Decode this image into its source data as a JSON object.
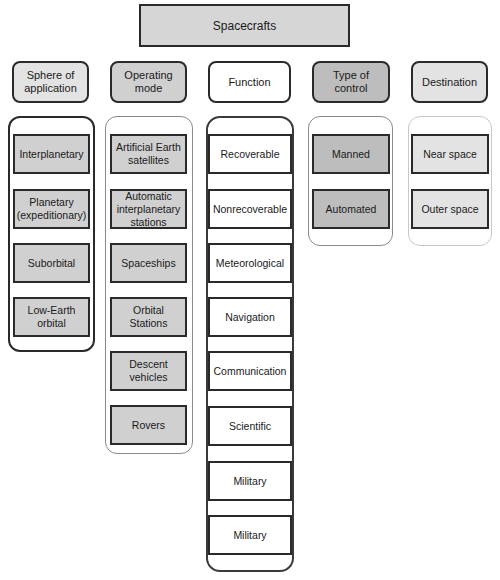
{
  "diagram": {
    "root": "Spacecrafts",
    "categories": [
      {
        "title": "Sphere of application",
        "items": [
          "Interplanetary",
          "Planetary (expeditionary)",
          "Suborbital",
          "Low-Earth orbital"
        ]
      },
      {
        "title": "Operating mode",
        "items": [
          "Artificial Earth satellites",
          "Automatic interplanetary stations",
          "Spaceships",
          "Orbital Stations",
          "Descent vehicles",
          "Rovers"
        ]
      },
      {
        "title": "Function",
        "items": [
          "Recoverable",
          "Nonrecoverable",
          "Meteorological",
          "Navigation",
          "Communication",
          "Scientific",
          "Military",
          "Military"
        ]
      },
      {
        "title": "Type of control",
        "items": [
          "Manned",
          "Automated"
        ]
      },
      {
        "title": "Destination",
        "items": [
          "Near space",
          "Outer space"
        ]
      }
    ]
  },
  "colors": {
    "border_dark": "#2a2a2a",
    "fill_light_gray": "#e3e3e3",
    "fill_mid_gray": "#d0d0d0",
    "fill_dark_gray": "#bdbdbd",
    "fill_white": "#ffffff"
  }
}
